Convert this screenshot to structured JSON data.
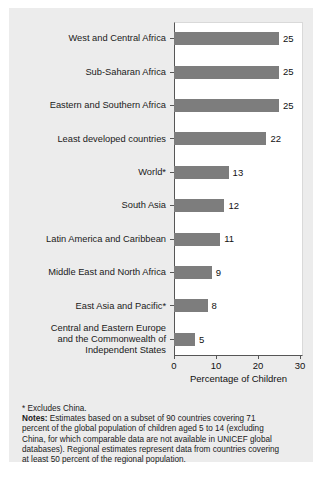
{
  "chart_data": {
    "type": "bar",
    "orientation": "horizontal",
    "title": "",
    "xlabel": "Percentage of Children",
    "ylabel": "",
    "xlim": [
      0,
      30
    ],
    "xticks": [
      0,
      10,
      20,
      30
    ],
    "xticklabels": [
      "0",
      "10",
      "20",
      "30"
    ],
    "grid": false,
    "legend": false,
    "bar_color": "#7d7d7d",
    "categories": [
      "West and Central Africa",
      "Sub-Saharan Africa",
      "Eastern and Southern Africa",
      "Least developed countries",
      "World*",
      "South Asia",
      "Latin America and Caribbean",
      "Middle East and North Africa",
      "East Asia and Pacific*",
      "Central and Eastern Europe\nand the Commonwealth of\nIndependent States"
    ],
    "values": [
      25,
      25,
      25,
      22,
      13,
      12,
      11,
      9,
      8,
      5
    ],
    "value_labels": [
      "25",
      "25",
      "25",
      "22",
      "13",
      "12",
      "11",
      "9",
      "8",
      "5"
    ]
  },
  "footnotes": {
    "asterisk": "* Excludes China.",
    "notes_label": "Notes:",
    "notes_text": " Estimates based on a subset of 90 countries covering 71 percent of the global population of children aged 5 to 14 (excluding China, for which comparable data are not available in UNICEF global databases). Regional estimates represent data from countries covering at least 50 percent of the regional population."
  }
}
